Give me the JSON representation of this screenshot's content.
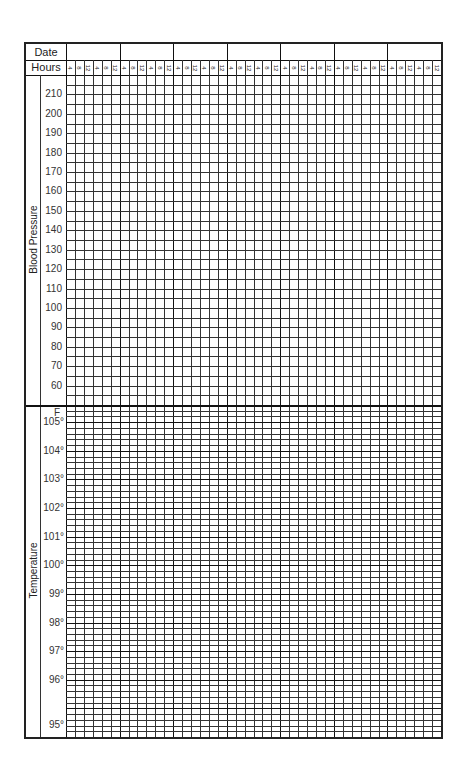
{
  "header": {
    "date_label": "Date",
    "hours_label": "Hours",
    "date_columns": [
      "",
      "",
      "",
      "",
      "",
      "",
      ""
    ],
    "hour_ticks": [
      "4",
      "8",
      "12",
      "4",
      "8",
      "12"
    ]
  },
  "blood_pressure": {
    "title": "Blood Pressure",
    "labels": [
      "210",
      "200",
      "190",
      "180",
      "170",
      "160",
      "150",
      "140",
      "130",
      "120",
      "110",
      "100",
      "90",
      "80",
      "70",
      "60"
    ],
    "rows_per_label": 2
  },
  "temperature": {
    "title": "Temperature",
    "unit_label": "F",
    "labels": [
      "105°",
      "104°",
      "103°",
      "102°",
      "101°",
      "100°",
      "99°",
      "98°",
      "97°",
      "96°",
      "95°"
    ],
    "rows_per_degree": 5
  },
  "colors": {
    "line": "#333333",
    "border": "#222222",
    "background": "#ffffff"
  }
}
